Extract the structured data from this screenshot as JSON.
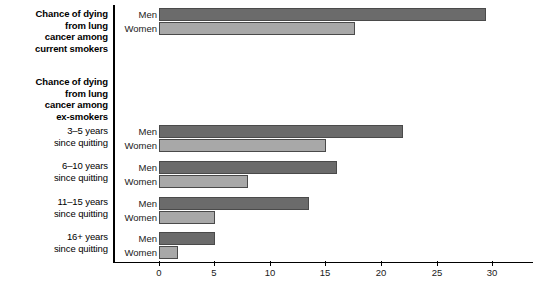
{
  "chart_data": {
    "type": "bar",
    "orientation": "horizontal",
    "title": "",
    "xlabel": "",
    "ylabel": "",
    "xlim": [
      0,
      31
    ],
    "xticks": [
      0,
      5,
      10,
      15,
      20,
      25,
      30
    ],
    "xticklabels": [
      "0",
      "5",
      "10",
      "15",
      "20",
      "25",
      "30"
    ],
    "grid": false,
    "legend": "inline-row-labels",
    "series": [
      {
        "name": "Men",
        "color": "#6b6b6b",
        "values": [
          29.5,
          22.0,
          16.0,
          13.5,
          5.0
        ]
      },
      {
        "name": "Women",
        "color": "#a8a8a8",
        "values": [
          17.7,
          15.0,
          8.0,
          5.0,
          1.7
        ]
      }
    ],
    "categories": [
      "Chance of dying from lung cancer among current smokers",
      "3–5 years since quitting",
      "6–10 years since quitting",
      "11–15 years since quitting",
      "16+ years since quitting"
    ]
  },
  "left_labels": [
    {
      "id": "current-smokers",
      "weight": "bold",
      "lines": [
        "Chance of dying",
        "from lung",
        "cancer among",
        "current smokers"
      ]
    },
    {
      "id": "ex-smokers",
      "weight": "bold",
      "lines": [
        "Chance of dying",
        "from lung",
        "cancer among",
        "ex-smokers"
      ]
    },
    {
      "id": "3-5-years",
      "weight": "regular",
      "lines": [
        "3–5 years",
        "since quitting"
      ]
    },
    {
      "id": "6-10-years",
      "weight": "regular",
      "lines": [
        "6–10 years",
        "since quitting"
      ]
    },
    {
      "id": "11-15-years",
      "weight": "regular",
      "lines": [
        "11–15 years",
        "since quitting"
      ]
    },
    {
      "id": "16-plus-years",
      "weight": "regular",
      "lines": [
        "16+ years",
        "since quitting"
      ]
    }
  ],
  "series_labels": {
    "men": "Men",
    "women": "Women"
  },
  "groups": [
    {
      "id": "current-smokers",
      "men": 29.5,
      "women": 17.7
    },
    {
      "id": "3-5-years",
      "men": 22.0,
      "women": 15.0
    },
    {
      "id": "6-10-years",
      "men": 16.0,
      "women": 8.0
    },
    {
      "id": "11-15-years",
      "men": 13.5,
      "women": 5.0
    },
    {
      "id": "16-plus-years",
      "men": 5.0,
      "women": 1.7
    }
  ],
  "axis": {
    "ticks": [
      "0",
      "5",
      "10",
      "15",
      "20",
      "25",
      "30"
    ]
  },
  "colors": {
    "men": "#6b6b6b",
    "women": "#a8a8a8",
    "axis": "#000000",
    "background": "#ffffff"
  }
}
